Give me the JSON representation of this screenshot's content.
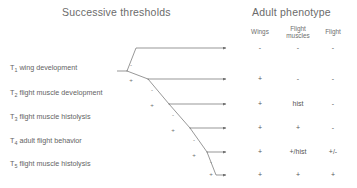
{
  "headers": {
    "left_title": "Successive thresholds",
    "right_title": "Adult phenotype",
    "columns": [
      {
        "label": "Wings"
      },
      {
        "label": "Flight\nmuscles"
      },
      {
        "label": "Flight"
      }
    ]
  },
  "thresholds": [
    {
      "id": "T",
      "sub": "1",
      "text": "wing development"
    },
    {
      "id": "T",
      "sub": "2",
      "text": "flight muscle development"
    },
    {
      "id": "T",
      "sub": "3",
      "text": "flight muscle histolysis"
    },
    {
      "id": "T",
      "sub": "4",
      "text": "adult flight behavior"
    },
    {
      "id": "T",
      "sub": "5",
      "text": "flight muscle histolysis"
    }
  ],
  "node_signs": [
    {
      "name": "t1-minus",
      "label": "-",
      "x": 131,
      "y": 61
    },
    {
      "name": "t1-plus",
      "label": "+",
      "x": 131,
      "y": 76
    },
    {
      "name": "t2-minus",
      "label": "-",
      "x": 152,
      "y": 86
    },
    {
      "name": "t2-plus",
      "label": "+",
      "x": 152,
      "y": 101
    },
    {
      "name": "t3-minus",
      "label": "-",
      "x": 173,
      "y": 111
    },
    {
      "name": "t3-plus",
      "label": "+",
      "x": 173,
      "y": 126
    },
    {
      "name": "t4-minus",
      "label": "-",
      "x": 194,
      "y": 136
    },
    {
      "name": "t4-plus",
      "label": "+",
      "x": 194,
      "y": 151
    },
    {
      "name": "t5-minus",
      "label": "-",
      "x": 211,
      "y": 158
    },
    {
      "name": "t5-plus",
      "label": "+",
      "x": 211,
      "y": 170
    }
  ],
  "outcomes": [
    {
      "y": 48,
      "wings": "-",
      "muscles": "-",
      "flight": "-"
    },
    {
      "y": 79,
      "wings": "+",
      "muscles": "-",
      "flight": "-"
    },
    {
      "y": 104,
      "wings": "+",
      "muscles": "hist",
      "flight": "-"
    },
    {
      "y": 128,
      "wings": "+",
      "muscles": "+",
      "flight": "-"
    },
    {
      "y": 152,
      "wings": "+",
      "muscles": "+/hist",
      "flight": "+/-"
    },
    {
      "y": 175,
      "wings": "+",
      "muscles": "+",
      "flight": "+"
    }
  ],
  "colors": {
    "line": "#6b6b6b",
    "text": "#5a5a5a",
    "background": "#ffffff"
  }
}
